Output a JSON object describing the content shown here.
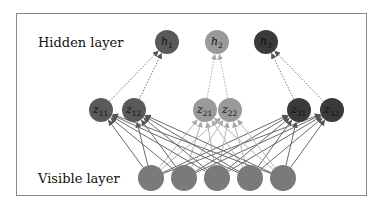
{
  "labels": {
    "hidden": "Hidden layer",
    "visible": "Visible layer"
  },
  "colors": {
    "h1": "#5a5a5a",
    "h2": "#9a9a9a",
    "h3": "#3a3a3a",
    "z1": "#5a5a5a",
    "z2": "#9a9a9a",
    "z3": "#3a3a3a",
    "visible": "#7a7a7a",
    "frame": "#8a8a8a"
  },
  "hidden_nodes": [
    {
      "id": "h1",
      "sym": "h",
      "sub": "1",
      "x": 167,
      "y": 42,
      "color": "#5a5a5a"
    },
    {
      "id": "h2",
      "sym": "h",
      "sub": "2",
      "x": 217,
      "y": 42,
      "color": "#9a9a9a"
    },
    {
      "id": "h3",
      "sym": "h",
      "sub": "3",
      "x": 266,
      "y": 42,
      "color": "#3a3a3a"
    }
  ],
  "z_nodes": [
    {
      "id": "z11",
      "sym": "z",
      "sub": "11",
      "x": 101,
      "y": 110,
      "color": "#5a5a5a",
      "parent": 0
    },
    {
      "id": "z12",
      "sym": "z",
      "sub": "12",
      "x": 134,
      "y": 110,
      "color": "#5a5a5a",
      "parent": 0
    },
    {
      "id": "z21",
      "sym": "z",
      "sub": "21",
      "x": 205,
      "y": 110,
      "color": "#9a9a9a",
      "parent": 1
    },
    {
      "id": "z22",
      "sym": "z",
      "sub": "22",
      "x": 230,
      "y": 110,
      "color": "#9a9a9a",
      "parent": 1
    },
    {
      "id": "z31",
      "sym": "z",
      "sub": "31",
      "x": 299,
      "y": 110,
      "color": "#3a3a3a",
      "parent": 2
    },
    {
      "id": "z32",
      "sym": "z",
      "sub": "32",
      "x": 332,
      "y": 110,
      "color": "#3a3a3a",
      "parent": 2
    }
  ],
  "visible_nodes": [
    {
      "id": "v1",
      "x": 151,
      "y": 178
    },
    {
      "id": "v2",
      "x": 184,
      "y": 178
    },
    {
      "id": "v3",
      "x": 217,
      "y": 178
    },
    {
      "id": "v4",
      "x": 250,
      "y": 178
    },
    {
      "id": "v5",
      "x": 283,
      "y": 178
    }
  ]
}
